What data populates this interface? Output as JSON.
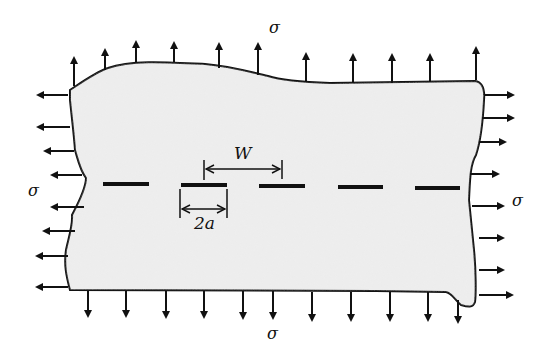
{
  "figure": {
    "plate_fill": "#ececec",
    "stroke_color": "#111111",
    "labels": {
      "sigma_top": "σ",
      "sigma_bottom": "σ",
      "sigma_left": "σ",
      "sigma_right": "σ",
      "crack_spacing": "W",
      "crack_length": "2a"
    },
    "crack_count": 5,
    "arrows": {
      "top_count": 11,
      "bottom_count": 11,
      "left_count": 9,
      "right_count": 8
    }
  }
}
